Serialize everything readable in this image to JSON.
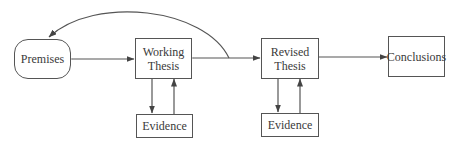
{
  "diagram": {
    "type": "flowchart",
    "nodes": {
      "premises": {
        "label": "Premises",
        "shape": "rounded-rect"
      },
      "working_thesis": {
        "line1": "Working",
        "line2": "Thesis",
        "shape": "rect"
      },
      "evidence_1": {
        "label": "Evidence",
        "shape": "rect"
      },
      "revised_thesis": {
        "line1": "Revised",
        "line2": "Thesis",
        "shape": "rect"
      },
      "evidence_2": {
        "label": "Evidence",
        "shape": "rect"
      },
      "conclusions": {
        "label": "Conclusions",
        "shape": "rect"
      }
    },
    "edges": [
      {
        "from": "premises",
        "to": "working_thesis",
        "direction": "bidirectional"
      },
      {
        "from": "working_thesis",
        "to": "revised_thesis",
        "direction": "bidirectional"
      },
      {
        "from": "working_thesis",
        "to": "evidence_1",
        "direction": "forward"
      },
      {
        "from": "evidence_1",
        "to": "working_thesis",
        "direction": "forward"
      },
      {
        "from": "revised_thesis",
        "to": "evidence_2",
        "direction": "forward"
      },
      {
        "from": "evidence_2",
        "to": "revised_thesis",
        "direction": "forward"
      },
      {
        "from": "revised_thesis",
        "to": "conclusions",
        "direction": "forward"
      },
      {
        "from": "working_thesis-revised_thesis-link",
        "to": "premises",
        "direction": "forward",
        "style": "curved-arc"
      }
    ],
    "colors": {
      "stroke": "#555555",
      "text": "#3a3a3a",
      "background": "#ffffff"
    }
  }
}
